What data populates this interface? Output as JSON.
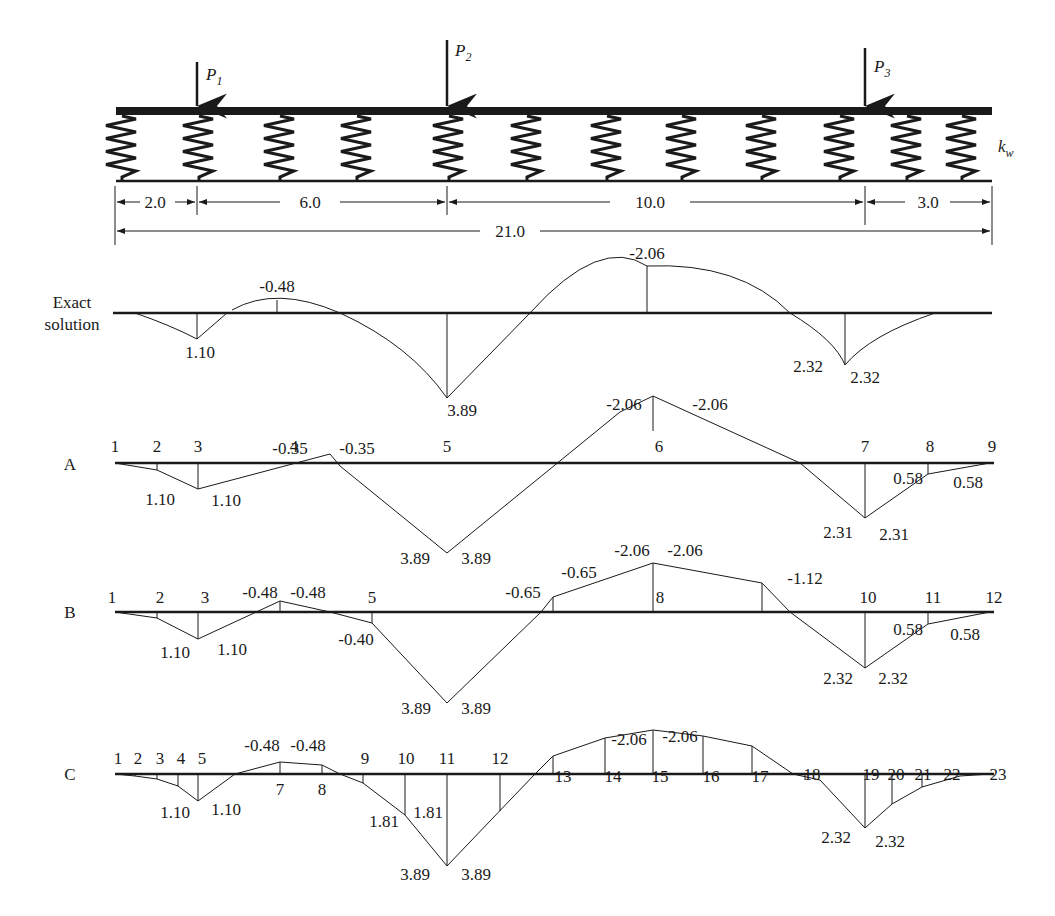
{
  "figure": {
    "loads": [
      {
        "name": "P",
        "sub": "1",
        "x_pos": 2.0
      },
      {
        "name": "P",
        "sub": "2",
        "x_pos": 8.0
      },
      {
        "name": "P",
        "sub": "3",
        "x_pos": 18.0
      }
    ],
    "spring_label": {
      "name": "k",
      "sub": "w"
    },
    "dimensions": {
      "segments": [
        "2.0",
        "6.0",
        "10.0",
        "3.0"
      ],
      "total": "21.0"
    },
    "colors": {
      "ink": "#1a1a1a",
      "background": "#ffffff"
    }
  },
  "chart_data": {
    "type": "line",
    "xlabel": "Beam position",
    "ylabel": "Moment",
    "beam_length": 21.0,
    "panels": [
      {
        "label": "Exact solution",
        "label_line1": "Exact",
        "label_line2": "solution",
        "points": [
          {
            "x": 2.0,
            "v": "1.10"
          },
          {
            "x": 5.0,
            "v": "-0.48"
          },
          {
            "x": 8.0,
            "v": "3.89"
          },
          {
            "x": 13.0,
            "v": "-2.06"
          },
          {
            "x": 18.0,
            "v": "2.32",
            "v2": "2.32"
          }
        ]
      },
      {
        "label": "A",
        "nodes": [
          "1",
          "2",
          "3",
          "4",
          "5",
          "6",
          "7",
          "8",
          "9"
        ],
        "node_x": [
          0,
          1,
          2,
          4.5,
          8,
          13,
          18,
          19.5,
          21
        ],
        "values": [
          0,
          0.3,
          1.1,
          -0.35,
          3.89,
          -2.06,
          2.31,
          0.58,
          0
        ],
        "annotations": [
          "1.10",
          "1.10",
          "-0.35",
          "-0.35",
          "3.89",
          "3.89",
          "-2.06",
          "-2.06",
          "2.31",
          "2.31",
          "0.58",
          "0.58"
        ]
      },
      {
        "label": "B",
        "nodes": [
          "1",
          "2",
          "3",
          "",
          "5",
          "",
          "",
          "8",
          "",
          "10",
          "11",
          "12"
        ],
        "node_x": [
          0,
          1,
          2,
          4,
          6.5,
          8,
          10.5,
          13,
          15.5,
          18,
          19.5,
          21
        ],
        "values": [
          0,
          0.3,
          1.1,
          -0.48,
          0.4,
          3.89,
          -0.65,
          -2.06,
          -1.12,
          2.32,
          0.58,
          0
        ],
        "annotations": [
          "1.10",
          "1.10",
          "-0.48",
          "-0.48",
          "-0.40",
          "3.89",
          "3.89",
          "-0.65",
          "-0.65",
          "-2.06",
          "-2.06",
          "-1.12",
          "2.32",
          "2.32",
          "0.58",
          "0.58"
        ]
      },
      {
        "label": "C",
        "nodes": [
          "1",
          "2",
          "3",
          "4",
          "5",
          "",
          "7",
          "8",
          "9",
          "10",
          "11",
          "12",
          "13",
          "14",
          "15",
          "16",
          "17",
          "18",
          "19",
          "20",
          "21",
          "22",
          "23"
        ],
        "node_x": [
          0,
          0.5,
          1,
          1.5,
          2,
          3,
          4,
          5.5,
          6.5,
          7.2,
          8,
          9.5,
          10.5,
          11.8,
          13,
          14.2,
          15.5,
          16.8,
          18,
          18.8,
          19.6,
          20.3,
          21
        ],
        "values": [
          0,
          0.08,
          0.28,
          0.6,
          1.1,
          0,
          -0.48,
          -0.4,
          0.3,
          1.81,
          3.89,
          1.7,
          -0.65,
          -1.7,
          -2.06,
          -1.8,
          -1.1,
          0.2,
          2.32,
          1.3,
          0.6,
          0.15,
          0
        ],
        "annotations": [
          "1.10",
          "1.10",
          "-0.48",
          "-0.48",
          "1.81",
          "1.81",
          "3.89",
          "3.89",
          "-2.06",
          "-2.06",
          "2.32",
          "2.32"
        ]
      }
    ]
  },
  "text": {
    "panel_A": "A",
    "panel_B": "B",
    "panel_C": "C",
    "exact_1": "Exact",
    "exact_2": "solution"
  }
}
